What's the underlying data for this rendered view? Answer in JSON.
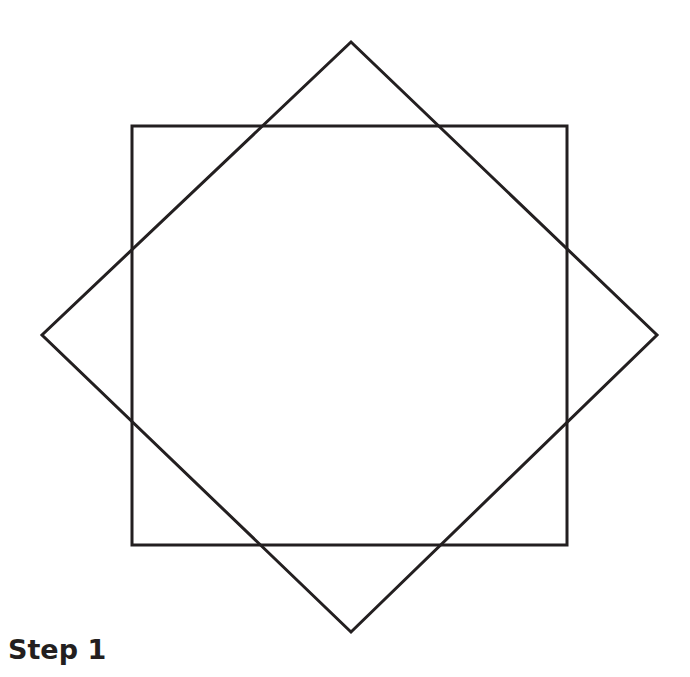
{
  "caption": "Step 1",
  "colors": {
    "stroke": "#231f20",
    "background": "#ffffff"
  },
  "shapes": {
    "square": {
      "label": "axis-aligned square",
      "x": 132,
      "y": 126,
      "width": 435,
      "height": 419
    },
    "diamond": {
      "label": "rotated square (diamond)",
      "top": [
        351,
        42
      ],
      "right": [
        657,
        335
      ],
      "bottom": [
        351,
        632
      ],
      "left": [
        42,
        335
      ]
    }
  }
}
